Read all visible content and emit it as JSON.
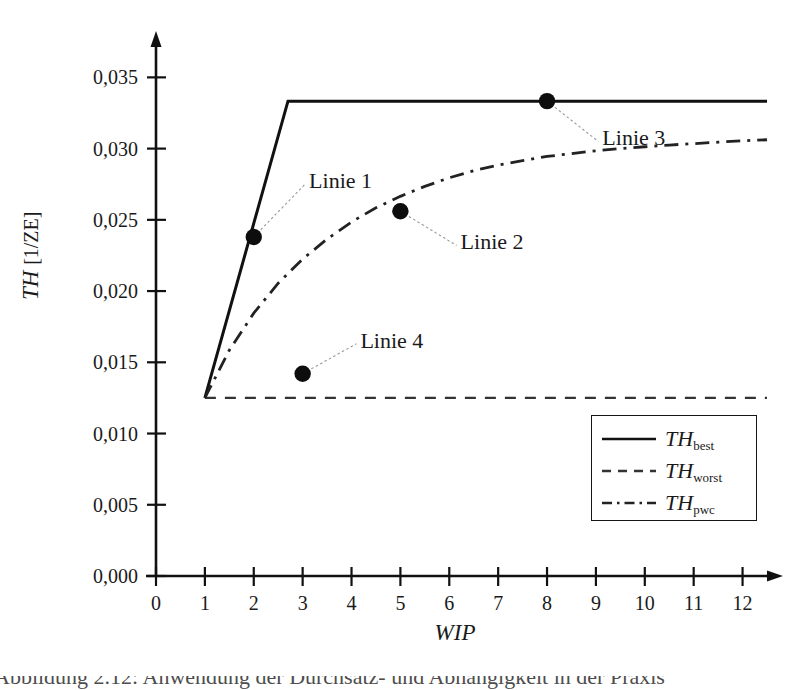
{
  "chart_data": {
    "type": "line",
    "title": "",
    "xlabel": "WIP",
    "ylabel": "TH [1/ZE]",
    "ylabel_symbol": "TH",
    "ylabel_unit": "[1/ZE]",
    "xlim": [
      0,
      12.5
    ],
    "ylim": [
      0.0,
      0.0365
    ],
    "grid": false,
    "legend_position": "lower-right",
    "xticks": [
      "0",
      "1",
      "2",
      "3",
      "4",
      "5",
      "6",
      "7",
      "8",
      "9",
      "10",
      "11",
      "12"
    ],
    "xtick_values": [
      0,
      1,
      2,
      3,
      4,
      5,
      6,
      7,
      8,
      9,
      10,
      11,
      12
    ],
    "yticks": [
      "0,000",
      "0,005",
      "0,010",
      "0,015",
      "0,020",
      "0,025",
      "0,030",
      "0,035"
    ],
    "ytick_values": [
      0.0,
      0.005,
      0.01,
      0.015,
      0.02,
      0.025,
      0.03,
      0.035
    ],
    "series": [
      {
        "name": "TH_best",
        "legend_symbol": "TH",
        "legend_sub": "best",
        "style": "solid",
        "color": "#111111",
        "x": [
          1.0,
          2.7,
          12.5
        ],
        "values": [
          0.0125,
          0.03333,
          0.03333
        ]
      },
      {
        "name": "TH_worst",
        "legend_symbol": "TH",
        "legend_sub": "worst",
        "style": "dashed",
        "color": "#333333",
        "x": [
          1.0,
          12.5
        ],
        "values": [
          0.0125,
          0.0125
        ]
      },
      {
        "name": "TH_pwc",
        "legend_symbol": "TH",
        "legend_sub": "pwc",
        "style": "dashdot",
        "color": "#222222",
        "x": [
          1.0,
          1.5,
          2.0,
          2.5,
          3.0,
          3.5,
          4.0,
          4.5,
          5.0,
          5.5,
          6.0,
          6.5,
          7.0,
          7.5,
          8.0,
          8.5,
          9.0,
          9.5,
          10.0,
          10.5,
          11.0,
          11.5,
          12.0,
          12.5
        ],
        "values": [
          0.0125,
          0.01585,
          0.01845,
          0.02055,
          0.02225,
          0.02365,
          0.02485,
          0.02585,
          0.02665,
          0.02735,
          0.02795,
          0.02845,
          0.02885,
          0.02915,
          0.02945,
          0.02965,
          0.02985,
          0.03,
          0.03013,
          0.03025,
          0.03035,
          0.03045,
          0.03055,
          0.03062
        ]
      }
    ],
    "annotations": [
      {
        "label": "Linie 1",
        "point_x": 2.0,
        "point_y": 0.0238,
        "text_x": 3.05,
        "text_y": 0.0275
      },
      {
        "label": "Linie 2",
        "point_x": 5.0,
        "point_y": 0.0256,
        "text_x": 6.15,
        "text_y": 0.0232
      },
      {
        "label": "Linie 3",
        "point_x": 8.0,
        "point_y": 0.03333,
        "text_x": 9.05,
        "text_y": 0.0305
      },
      {
        "label": "Linie 4",
        "point_x": 3.0,
        "point_y": 0.0142,
        "text_x": 4.1,
        "text_y": 0.0163
      }
    ]
  },
  "legend": {
    "entries": [
      {
        "symbol": "TH",
        "sub": "best",
        "style": "solid"
      },
      {
        "symbol": "TH",
        "sub": "worst",
        "style": "dashed"
      },
      {
        "symbol": "TH",
        "sub": "pwc",
        "style": "dashdot"
      }
    ]
  },
  "caption": {
    "partial_text": "Abbildung 2.12: Anwendung der Durchsatz- und Abhängigkeit in der Praxis"
  }
}
